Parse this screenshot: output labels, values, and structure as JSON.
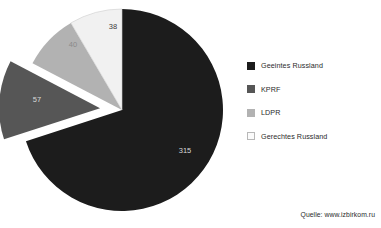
{
  "chart_data": {
    "type": "pie",
    "title": "",
    "subtitle": "",
    "xlabel": "",
    "ylabel": "",
    "total": 450,
    "start_angle_deg": 0,
    "direction": "clockwise",
    "grid": false,
    "legend_position": "right",
    "categories": [
      "Geeintes Russland",
      "KPRF",
      "LDPR",
      "Gerechtes Russland"
    ],
    "values": [
      315,
      57,
      40,
      38
    ],
    "colors": [
      "#1c1c1c",
      "#565656",
      "#b2b2b2",
      "#f1f1f1"
    ],
    "exploded": [
      "KPRF"
    ],
    "slices": [
      {
        "label": "Geeintes Russland",
        "value": 315,
        "value_text": "315",
        "color": "#1c1c1c",
        "label_color": "#d8d8d8",
        "exploded": false,
        "start_deg": 0,
        "sweep_deg": 252,
        "label_x": 185,
        "label_y": 153
      },
      {
        "label": "KPRF",
        "value": 57,
        "value_text": "57",
        "color": "#565656",
        "label_color": "#d8d8d8",
        "exploded": true,
        "start_deg": 252,
        "sweep_deg": 45.6,
        "label_x": 37,
        "label_y": 102
      },
      {
        "label": "LDPR",
        "value": 40,
        "value_text": "40",
        "color": "#b2b2b2",
        "label_color": "#8a8a8a",
        "exploded": false,
        "start_deg": 297.6,
        "sweep_deg": 32,
        "label_x": 73,
        "label_y": 47
      },
      {
        "label": "Gerechtes Russland",
        "value": 38,
        "value_text": "38",
        "color": "#f1f1f1",
        "label_color": "#3c3c3c",
        "exploded": false,
        "start_deg": 329.6,
        "sweep_deg": 30.4,
        "label_x": 113,
        "label_y": 29
      }
    ]
  },
  "legend": {
    "items": [
      {
        "label": "Geeintes Russland",
        "color": "#1c1c1c",
        "border": "#1c1c1c"
      },
      {
        "label": "KPRF",
        "color": "#565656",
        "border": "#565656"
      },
      {
        "label": "LDPR",
        "color": "#b2b2b2",
        "border": "#b2b2b2"
      },
      {
        "label": "Gerechtes Russland",
        "color": "#fbfbfb",
        "border": "#b8b8b8"
      }
    ]
  },
  "source": {
    "text": "Quelle: www.izbirkom.ru"
  }
}
